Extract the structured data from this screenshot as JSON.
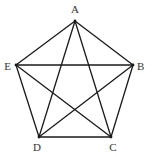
{
  "diagram": {
    "type": "complete-graph-pentagon",
    "vertices": [
      {
        "id": "A",
        "label": "A",
        "x": 75,
        "y": 21,
        "label_x": 75,
        "label_y": 13,
        "anchor": "middle"
      },
      {
        "id": "B",
        "label": "B",
        "x": 133,
        "y": 65,
        "label_x": 137,
        "label_y": 70,
        "anchor": "start"
      },
      {
        "id": "C",
        "label": "C",
        "x": 111,
        "y": 137,
        "label_x": 113,
        "label_y": 151,
        "anchor": "middle"
      },
      {
        "id": "D",
        "label": "D",
        "x": 39,
        "y": 137,
        "label_x": 37,
        "label_y": 151,
        "anchor": "middle"
      },
      {
        "id": "E",
        "label": "E",
        "x": 16,
        "y": 65,
        "label_x": 11,
        "label_y": 70,
        "anchor": "end"
      }
    ],
    "edges": [
      [
        "A",
        "B"
      ],
      [
        "B",
        "C"
      ],
      [
        "C",
        "D"
      ],
      [
        "D",
        "E"
      ],
      [
        "E",
        "A"
      ],
      [
        "A",
        "C"
      ],
      [
        "A",
        "D"
      ],
      [
        "B",
        "D"
      ],
      [
        "B",
        "E"
      ],
      [
        "C",
        "E"
      ]
    ],
    "colors": {
      "stroke": "#1a1a1a",
      "label": "#333333",
      "background": "#ffffff"
    }
  }
}
